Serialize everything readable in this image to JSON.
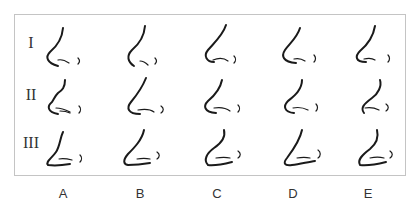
{
  "figure": {
    "rows": [
      {
        "label": "I"
      },
      {
        "label": "II"
      },
      {
        "label": "III"
      }
    ],
    "columns": [
      {
        "label": "A"
      },
      {
        "label": "B"
      },
      {
        "label": "C"
      },
      {
        "label": "D"
      },
      {
        "label": "E"
      }
    ],
    "stroke_color": "#1a1a1a",
    "border_color": "#c4c4c4"
  }
}
